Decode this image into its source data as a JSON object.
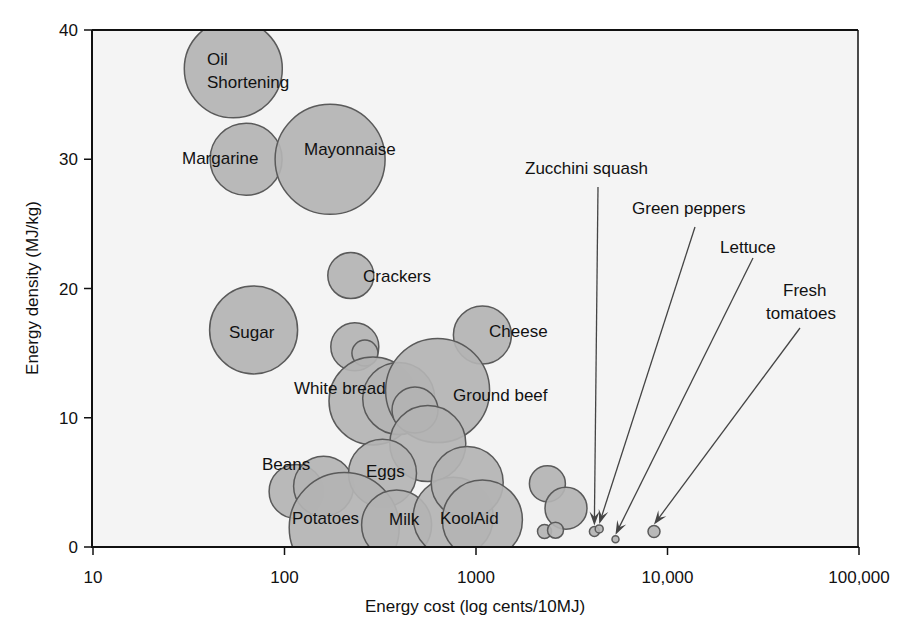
{
  "chart_data": {
    "type": "scatter",
    "subtype": "bubble",
    "title": "",
    "xlabel": "Energy cost (log cents/10MJ)",
    "ylabel": "Energy density (MJ/kg)",
    "xscale": "log",
    "xlim": [
      10,
      100000
    ],
    "ylim": [
      0,
      40
    ],
    "x_ticks": [
      10,
      100,
      1000,
      10000,
      100000
    ],
    "x_tick_labels": [
      "10",
      "100",
      "1000",
      "10,000",
      "100,000"
    ],
    "y_ticks": [
      0,
      10,
      20,
      30,
      40
    ],
    "y_tick_labels": [
      "0",
      "10",
      "20",
      "30",
      "40"
    ],
    "grid": false,
    "legend": null,
    "colors": {
      "bubble_fill": "#b3b3b3",
      "bubble_stroke": "#5a5a5a",
      "plot_bg": "#f4f4f4",
      "axis": "#111111"
    },
    "points": [
      {
        "label": "Oil Shortening",
        "x": 54,
        "y": 37.0,
        "size": 49
      },
      {
        "label": "Margarine",
        "x": 63,
        "y": 30.0,
        "size": 36
      },
      {
        "label": "Mayonnaise",
        "x": 173,
        "y": 30.0,
        "size": 55
      },
      {
        "label": "Crackers",
        "x": 222,
        "y": 21.0,
        "size": 23
      },
      {
        "label": "Sugar",
        "x": 69,
        "y": 16.8,
        "size": 44
      },
      {
        "label": "",
        "x": 233,
        "y": 15.5,
        "size": 24
      },
      {
        "label": "",
        "x": 263,
        "y": 15.0,
        "size": 13
      },
      {
        "label": "Cheese",
        "x": 1080,
        "y": 16.4,
        "size": 29
      },
      {
        "label": "",
        "x": 290,
        "y": 11.3,
        "size": 44
      },
      {
        "label": "White bread",
        "x": 395,
        "y": 11.5,
        "size": 36
      },
      {
        "label": "Ground beef",
        "x": 630,
        "y": 12.1,
        "size": 52
      },
      {
        "label": "",
        "x": 480,
        "y": 10.6,
        "size": 23
      },
      {
        "label": "",
        "x": 560,
        "y": 8.0,
        "size": 38
      },
      {
        "label": "Beans",
        "x": 115,
        "y": 4.3,
        "size": 27
      },
      {
        "label": "",
        "x": 160,
        "y": 4.7,
        "size": 30
      },
      {
        "label": "Eggs",
        "x": 325,
        "y": 5.7,
        "size": 34
      },
      {
        "label": "Potatoes",
        "x": 205,
        "y": 1.5,
        "size": 55
      },
      {
        "label": "Milk",
        "x": 385,
        "y": 1.7,
        "size": 35
      },
      {
        "label": "KoolAid",
        "x": 760,
        "y": 2.3,
        "size": 40
      },
      {
        "label": "",
        "x": 900,
        "y": 5.0,
        "size": 36
      },
      {
        "label": "",
        "x": 1080,
        "y": 2.1,
        "size": 40
      },
      {
        "label": "",
        "x": 2360,
        "y": 4.9,
        "size": 18
      },
      {
        "label": "",
        "x": 2950,
        "y": 3.0,
        "size": 21
      },
      {
        "label": "",
        "x": 2280,
        "y": 1.2,
        "size": 7
      },
      {
        "label": "",
        "x": 2600,
        "y": 1.3,
        "size": 8
      },
      {
        "label": "Zucchini squash",
        "x": 4150,
        "y": 1.2,
        "size": 5
      },
      {
        "label": "Green peppers",
        "x": 4400,
        "y": 1.4,
        "size": 4
      },
      {
        "label": "Lettuce",
        "x": 5350,
        "y": 0.6,
        "size": 3.5
      },
      {
        "label": "Fresh tomatoes",
        "x": 8500,
        "y": 1.2,
        "size": 6
      }
    ],
    "annotations": [
      {
        "text": "Zucchini squash",
        "target": "Zucchini squash",
        "arrow": true
      },
      {
        "text": "Green peppers",
        "target": "Green peppers",
        "arrow": true
      },
      {
        "text": "Lettuce",
        "target": "Lettuce",
        "arrow": true
      },
      {
        "text": "Fresh tomatoes",
        "target": "Fresh tomatoes",
        "arrow": true
      }
    ]
  },
  "labels": {
    "oil": "Oil",
    "shortening": "Shortening",
    "margarine": "Margarine",
    "mayonnaise": "Mayonnaise",
    "crackers": "Crackers",
    "sugar": "Sugar",
    "cheese": "Cheese",
    "white_bread": "White bread",
    "ground_beef": "Ground beef",
    "beans": "Beans",
    "eggs": "Eggs",
    "potatoes": "Potatoes",
    "milk": "Milk",
    "koolaid": "KoolAid",
    "zucchini": "Zucchini squash",
    "green_peppers": "Green peppers",
    "lettuce": "Lettuce",
    "fresh": "Fresh",
    "tomatoes": "tomatoes"
  }
}
